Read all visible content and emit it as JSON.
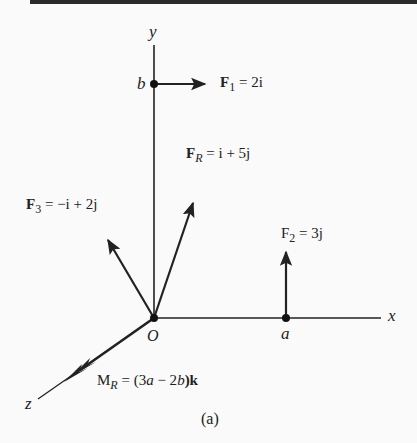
{
  "figure": {
    "caption": "(a)",
    "axes": {
      "x_label": "x",
      "y_label": "y",
      "z_label": "z",
      "origin_label": "O"
    },
    "points": {
      "b_label": "b",
      "a_label": "a"
    },
    "forces": {
      "F1": {
        "name": "F",
        "sub": "1",
        "expr": "= 2i"
      },
      "F2": {
        "name": "F",
        "sub": "2",
        "expr": "= 3j"
      },
      "F3": {
        "name": "F",
        "sub": "3",
        "expr": "= −i + 2j"
      },
      "FR": {
        "name": "F",
        "sub": "R",
        "expr": "= i + 5j"
      },
      "MR": {
        "name": "M",
        "sub": "R",
        "expr_pre": "= (3",
        "a": "a",
        "mid": " − 2",
        "b": "b",
        "expr_post": ")k"
      }
    },
    "colors": {
      "ink": "#222222",
      "background": "#fafafa",
      "topbar": "#2a2a2a"
    }
  }
}
